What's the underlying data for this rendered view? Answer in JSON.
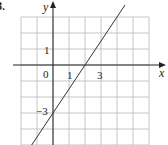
{
  "problem_number": "3.",
  "chart_data": {
    "type": "line",
    "title": "",
    "xlabel": "x",
    "ylabel": "y",
    "xlim": [
      -2,
      6
    ],
    "ylim": [
      -5,
      3
    ],
    "grid": true,
    "tick_labels": {
      "x": [
        "0",
        "1",
        "3"
      ],
      "y": [
        "1",
        "-3"
      ]
    },
    "annotations": [
      "0",
      "1",
      "3",
      "1",
      "−3"
    ],
    "series": [
      {
        "name": "line",
        "equation": "y = 1.5x - 3",
        "x": [
          -1.5,
          0,
          2,
          4.5
        ],
        "y": [
          -5.25,
          -3,
          0,
          3.75
        ]
      }
    ],
    "line_color": "#333333",
    "grid_color": "#b8b8b8"
  },
  "labels": {
    "x_axis": "x",
    "y_axis": "y",
    "origin": "0",
    "x_tick_1": "1",
    "x_tick_3": "3",
    "y_tick_1": "1",
    "y_tick_neg3": "−3"
  }
}
